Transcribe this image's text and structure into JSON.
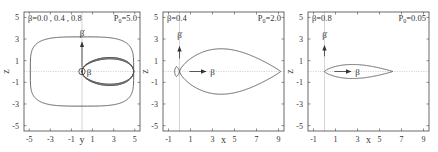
{
  "chart_data": [
    {
      "type": "line",
      "panel": 1,
      "title_left": "β=0.0 , 0.4 , 0.8",
      "title_right_base": "P",
      "title_right_sub": "0",
      "title_right_value": "=5.0",
      "xlabel": "y",
      "ylabel": "z",
      "xlim": [
        -5.5,
        5.5
      ],
      "ylim": [
        -5.5,
        5.5
      ],
      "xticks": [
        -5,
        -3,
        -1,
        1,
        3,
        5
      ],
      "yticks": [
        -5,
        -3,
        -1,
        1,
        3,
        5
      ],
      "xtick_labels": [
        "-5",
        "-3",
        "-1",
        "1",
        "3",
        "5"
      ],
      "ytick_labels": [
        "-5",
        "-3",
        "-1",
        "1",
        "3",
        "5"
      ],
      "annotations": [
        {
          "text": "β",
          "dot": true,
          "at": [
            0,
            3.1
          ],
          "arrow_from": [
            0,
            0
          ],
          "arrow_to": [
            0,
            2.7
          ],
          "note": "beta-dot vertical arrow"
        },
        {
          "text": "β",
          "at": [
            0.6,
            0
          ],
          "note": "beta out of plane (circle symbol)"
        }
      ],
      "series": [
        {
          "name": "β=0.0",
          "shape": "figure-eight",
          "half_width": 4.9,
          "half_height": 2.0
        },
        {
          "name": "β=0.4",
          "shape": "figure-eight",
          "half_width": 4.9,
          "half_height": 2.2
        },
        {
          "name": "β=0.8",
          "shape": "oval",
          "half_width": 4.9,
          "half_height": 3.2
        }
      ]
    },
    {
      "type": "line",
      "panel": 2,
      "title_left": "β=0.4",
      "title_right_base": "P",
      "title_right_sub": "0",
      "title_right_value": "=2.0",
      "xlabel": "x",
      "ylabel": "z",
      "xlim": [
        -1.5,
        9.5
      ],
      "ylim": [
        -5.5,
        5.5
      ],
      "xticks": [
        -1,
        1,
        3,
        5,
        7,
        9
      ],
      "yticks": [
        -5,
        -3,
        -1,
        1,
        3,
        5
      ],
      "xtick_labels": [
        "-1",
        "1",
        "3",
        "5",
        "7",
        "9"
      ],
      "ytick_labels": [
        "-5",
        "-3",
        "-1",
        "1",
        "3",
        "5"
      ],
      "annotations": [
        {
          "text": "β",
          "dot": true,
          "at": [
            0,
            3.1
          ],
          "arrow_from": [
            0,
            1.2
          ],
          "arrow_to": [
            0,
            2.3
          ]
        },
        {
          "text": "β",
          "at": [
            2.7,
            0
          ],
          "arrow_from": [
            0.9,
            0
          ],
          "arrow_to": [
            2.4,
            0
          ]
        }
      ],
      "series": [
        {
          "name": "forward lobe",
          "x_range": [
            0,
            9.2
          ],
          "max_half_height": 2.1,
          "peak_x": 5.2
        },
        {
          "name": "backward lobe",
          "x_range": [
            -0.45,
            0
          ],
          "max_half_height": 0.45
        }
      ]
    },
    {
      "type": "line",
      "panel": 3,
      "title_left": "β=0.8",
      "title_right_base": "P",
      "title_right_sub": "0",
      "title_right_value": "=0.05",
      "xlabel": "x",
      "ylabel": "z",
      "xlim": [
        -1.5,
        9.5
      ],
      "ylim": [
        -5.5,
        5.5
      ],
      "xticks": [
        -1,
        1,
        3,
        5,
        7,
        9
      ],
      "yticks": [
        -5,
        -3,
        -1,
        1,
        3,
        5
      ],
      "xtick_labels": [
        "-1",
        "1",
        "3",
        "5",
        "7",
        "9"
      ],
      "ytick_labels": [
        "-5",
        "-3",
        "-1",
        "1",
        "3",
        "5"
      ],
      "annotations": [
        {
          "text": "β",
          "dot": true,
          "at": [
            0,
            3.1
          ],
          "arrow_from": [
            0,
            1.4
          ],
          "arrow_to": [
            0,
            2.4
          ]
        },
        {
          "text": "β",
          "at": [
            2.7,
            0
          ],
          "arrow_from": [
            0.9,
            0
          ],
          "arrow_to": [
            2.4,
            0
          ]
        }
      ],
      "series": [
        {
          "name": "forward lobe",
          "x_range": [
            0,
            6.2
          ],
          "max_half_height": 0.65,
          "peak_x": 3.9
        }
      ]
    }
  ]
}
